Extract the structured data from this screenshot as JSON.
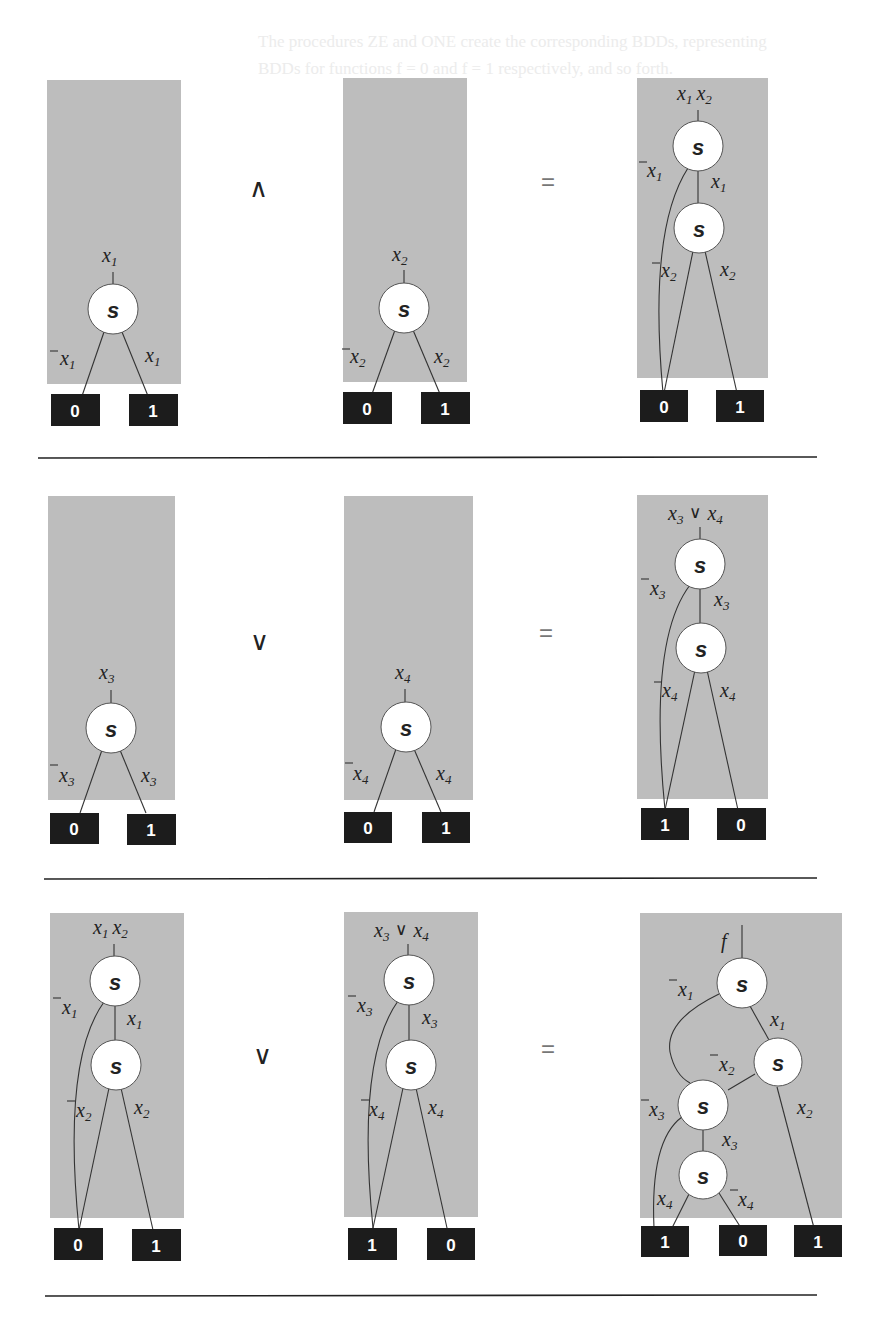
{
  "background_text": [
    "The procedures ZE and ONE create the corresponding BDDs, representing",
    "BDDs for functions f = 0 and f = 1 respectively, and so forth."
  ],
  "operators": {
    "and": "∧",
    "or": "∨",
    "equals": "="
  },
  "rows": [
    {
      "operator": "∧",
      "left": {
        "root_label": "x1",
        "nodes": [
          {
            "id": "n1",
            "label": "s",
            "var": "x1"
          }
        ],
        "edges": [
          {
            "from": "n1",
            "to": "t0",
            "label": "¬x1"
          },
          {
            "from": "n1",
            "to": "t1",
            "label": "x1"
          }
        ],
        "terminals": [
          "0",
          "1"
        ]
      },
      "right": {
        "root_label": "x2",
        "nodes": [
          {
            "id": "n1",
            "label": "s",
            "var": "x2"
          }
        ],
        "edges": [
          {
            "from": "n1",
            "to": "t0",
            "label": "¬x2"
          },
          {
            "from": "n1",
            "to": "t1",
            "label": "x2"
          }
        ],
        "terminals": [
          "0",
          "1"
        ]
      },
      "result": {
        "root_label": "x1 x2",
        "nodes": [
          {
            "id": "n1",
            "label": "s",
            "var": "x1"
          },
          {
            "id": "n2",
            "label": "s",
            "var": "x2"
          }
        ],
        "edges": [
          {
            "from": "n1",
            "to": "t0",
            "label": "¬x1"
          },
          {
            "from": "n1",
            "to": "n2",
            "label": "x1"
          },
          {
            "from": "n2",
            "to": "t0",
            "label": "¬x2"
          },
          {
            "from": "n2",
            "to": "t1",
            "label": "x2"
          }
        ],
        "terminals": [
          "0",
          "1"
        ]
      }
    },
    {
      "operator": "∨",
      "left": {
        "root_label": "x3",
        "nodes": [
          {
            "id": "n1",
            "label": "s",
            "var": "x3"
          }
        ],
        "edges": [
          {
            "from": "n1",
            "to": "t0",
            "label": "¬x3"
          },
          {
            "from": "n1",
            "to": "t1",
            "label": "x3"
          }
        ],
        "terminals": [
          "0",
          "1"
        ]
      },
      "right": {
        "root_label": "x4",
        "nodes": [
          {
            "id": "n1",
            "label": "s",
            "var": "x4"
          }
        ],
        "edges": [
          {
            "from": "n1",
            "to": "t0",
            "label": "¬x4"
          },
          {
            "from": "n1",
            "to": "t1",
            "label": "x4"
          }
        ],
        "terminals": [
          "0",
          "1"
        ]
      },
      "result": {
        "root_label": "x3 ∨ x4",
        "nodes": [
          {
            "id": "n1",
            "label": "s",
            "var": "x3"
          },
          {
            "id": "n2",
            "label": "s",
            "var": "x4"
          }
        ],
        "edges": [
          {
            "from": "n1",
            "to": "t1",
            "label": "¬x3"
          },
          {
            "from": "n1",
            "to": "n2",
            "label": "x3"
          },
          {
            "from": "n2",
            "to": "t1",
            "label": "¬x4"
          },
          {
            "from": "n2",
            "to": "t0",
            "label": "x4"
          }
        ],
        "terminals": [
          "1",
          "0"
        ]
      }
    },
    {
      "operator": "∨",
      "left": {
        "root_label": "x1 x2",
        "nodes": [
          {
            "id": "n1",
            "label": "s",
            "var": "x1"
          },
          {
            "id": "n2",
            "label": "s",
            "var": "x2"
          }
        ],
        "edges": [
          {
            "from": "n1",
            "to": "t0",
            "label": "¬x1"
          },
          {
            "from": "n1",
            "to": "n2",
            "label": "x1"
          },
          {
            "from": "n2",
            "to": "t0",
            "label": "¬x2"
          },
          {
            "from": "n2",
            "to": "t1",
            "label": "x2"
          }
        ],
        "terminals": [
          "0",
          "1"
        ]
      },
      "right": {
        "root_label": "x3 ∨ x4",
        "nodes": [
          {
            "id": "n1",
            "label": "s",
            "var": "x3"
          },
          {
            "id": "n2",
            "label": "s",
            "var": "x4"
          }
        ],
        "edges": [
          {
            "from": "n1",
            "to": "t1",
            "label": "¬x3"
          },
          {
            "from": "n1",
            "to": "n2",
            "label": "x3"
          },
          {
            "from": "n2",
            "to": "t1",
            "label": "¬x4"
          },
          {
            "from": "n2",
            "to": "t0",
            "label": "x4"
          }
        ],
        "terminals": [
          "1",
          "0"
        ]
      },
      "result": {
        "root_label": "f",
        "nodes": [
          {
            "id": "n1",
            "label": "s",
            "var": "x1"
          },
          {
            "id": "n2",
            "label": "s",
            "var": "x2"
          },
          {
            "id": "n3",
            "label": "s",
            "var": "x3"
          },
          {
            "id": "n4",
            "label": "s",
            "var": "x4"
          }
        ],
        "edges": [
          {
            "from": "n1",
            "to": "n3",
            "label": "¬x1"
          },
          {
            "from": "n1",
            "to": "n2",
            "label": "x1"
          },
          {
            "from": "n2",
            "to": "n3",
            "label": "¬x2"
          },
          {
            "from": "n2",
            "to": "t1b",
            "label": "x2"
          },
          {
            "from": "n3",
            "to": "t1a",
            "label": "¬x3"
          },
          {
            "from": "n3",
            "to": "n4",
            "label": "x3"
          },
          {
            "from": "n4",
            "to": "t1a",
            "label": "x4"
          },
          {
            "from": "n4",
            "to": "t0",
            "label": "¬x4"
          }
        ],
        "terminals": [
          "1",
          "0",
          "1"
        ]
      }
    }
  ],
  "labels": {
    "node": "s",
    "x": "x",
    "f": "f",
    "or": "∨",
    "s1": "1",
    "s2": "2",
    "s3": "3",
    "s4": "4",
    "t0": "0",
    "t1": "1"
  }
}
